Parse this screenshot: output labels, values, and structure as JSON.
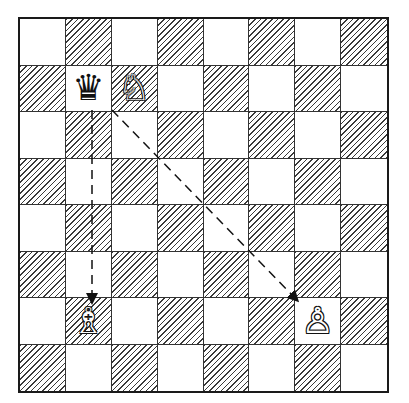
{
  "diagram": {
    "type": "chess-position",
    "board": {
      "files": [
        "a",
        "b",
        "c",
        "d",
        "e",
        "f",
        "g",
        "h"
      ],
      "ranks": [
        8,
        7,
        6,
        5,
        4,
        3,
        2,
        1
      ],
      "light_color": "#ffffff",
      "dark_style": "hatched",
      "line_color": "#1a1a1a"
    },
    "pieces": [
      {
        "square": "b7",
        "piece": "queen",
        "color": "black",
        "glyph": "♛"
      },
      {
        "square": "c7",
        "piece": "knight",
        "color": "white",
        "glyph": "♘"
      },
      {
        "square": "b2",
        "piece": "bishop",
        "color": "white",
        "glyph": "♗"
      },
      {
        "square": "g2",
        "piece": "pawn",
        "color": "white",
        "glyph": "♙"
      }
    ],
    "arrows": [
      {
        "from": "b7",
        "to": "b2",
        "style": "dashed",
        "label": "queen-to-bishop"
      },
      {
        "from": "b7",
        "to": "g2",
        "style": "dashed",
        "label": "queen-to-pawn-diagonal"
      }
    ]
  }
}
